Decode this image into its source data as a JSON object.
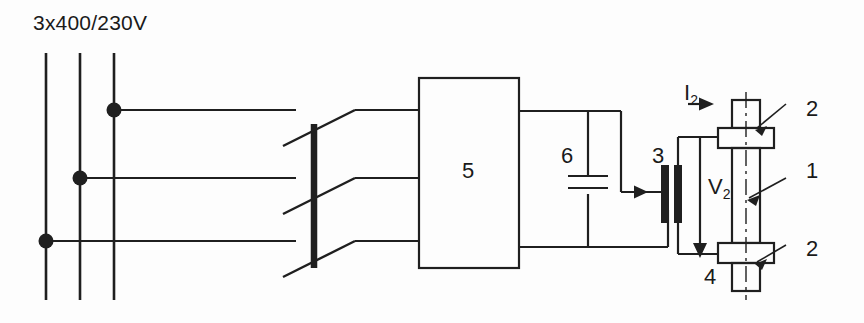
{
  "figure": {
    "type": "electrical-schematic",
    "stroke_color": "#1f1f1f",
    "background_color": "#fdfdfd"
  },
  "labels": {
    "supply": "3x400/230V",
    "converter": "5",
    "capacitor": "6",
    "transformer": "3",
    "workpiece": "1",
    "electrode_top": "2",
    "electrode_bottom": "2",
    "fixture": "4",
    "secondary_current": "I",
    "secondary_current_sub": "2",
    "secondary_voltage": "V",
    "secondary_voltage_sub": "2"
  },
  "components": [
    {
      "id": "1",
      "name": "workpiece",
      "label": "1"
    },
    {
      "id": "2a",
      "name": "electrode-clamp-top",
      "label": "2"
    },
    {
      "id": "2b",
      "name": "electrode-clamp-bottom",
      "label": "2"
    },
    {
      "id": "3",
      "name": "matching-transformer",
      "label": "3"
    },
    {
      "id": "4",
      "name": "fixture-base",
      "label": "4"
    },
    {
      "id": "5",
      "name": "frequency-converter",
      "label": "5"
    },
    {
      "id": "6",
      "name": "compensating-capacitor",
      "label": "6"
    }
  ],
  "supply": {
    "voltage_text": "3x400/230V",
    "phase_count": 3
  },
  "quantities": [
    {
      "symbol": "I2",
      "name": "secondary-current",
      "rendered": "I₂"
    },
    {
      "symbol": "V2",
      "name": "secondary-voltage",
      "rendered": "V₂"
    }
  ]
}
